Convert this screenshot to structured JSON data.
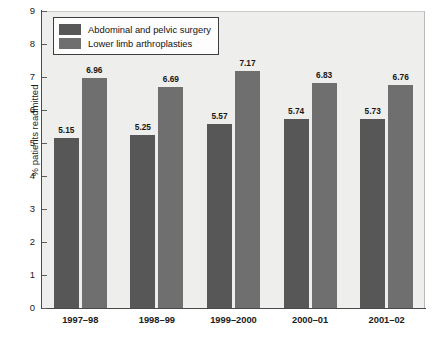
{
  "chart_data": {
    "type": "bar",
    "title": "to 2001-02",
    "xlabel": "",
    "ylabel": "% patients readmitted",
    "categories": [
      "1997–98",
      "1998–99",
      "1999–2000",
      "2000–01",
      "2001–02"
    ],
    "series": [
      {
        "name": "Abdominal and pelvic surgery",
        "color": "#575757",
        "values": [
          5.15,
          5.25,
          5.57,
          5.74,
          5.73
        ],
        "labels": [
          "5.15",
          "5.25",
          "5.57",
          "5.74",
          "5.73"
        ]
      },
      {
        "name": "Lower limb arthroplasties",
        "color": "#6f6f6f",
        "values": [
          6.96,
          6.69,
          7.17,
          6.83,
          6.76
        ],
        "labels": [
          "6.96",
          "6.69",
          "7.17",
          "6.83",
          "6.76"
        ]
      }
    ],
    "ylim": [
      0,
      9
    ],
    "yticks": [
      0,
      1,
      2,
      3,
      4,
      5,
      6,
      7,
      8,
      9
    ],
    "ytick_labels": [
      "0",
      "1",
      "2",
      "3",
      "4",
      "5",
      "6",
      "7",
      "8",
      "9"
    ],
    "grid": false,
    "legend_position": "upper left",
    "plot_background": "#eeeeec",
    "figure_background": "#ffffff"
  }
}
